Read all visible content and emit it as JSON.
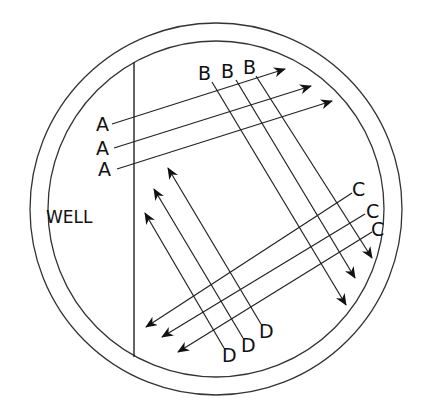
{
  "diagram": {
    "title": "",
    "plate": {
      "center": [
        216,
        209
      ],
      "outer_radius": 186,
      "inner_radius": 168,
      "line_color": "#333333"
    },
    "well": {
      "label": "WELL",
      "label_pos": [
        46,
        223
      ],
      "divider": {
        "x": 134,
        "y1": 62,
        "y2": 357
      }
    },
    "streak_sets": [
      {
        "letter": "A",
        "labels": [
          {
            "text": "A",
            "x": 96,
            "y": 131
          },
          {
            "text": "A",
            "x": 96,
            "y": 155
          },
          {
            "text": "A",
            "x": 98,
            "y": 176
          }
        ],
        "arrows": [
          {
            "x1": 112,
            "y1": 124,
            "x2": 285,
            "y2": 69
          },
          {
            "x1": 114,
            "y1": 148,
            "x2": 311,
            "y2": 86
          },
          {
            "x1": 117,
            "y1": 169,
            "x2": 332,
            "y2": 101
          }
        ]
      },
      {
        "letter": "B",
        "labels": [
          {
            "text": "B",
            "x": 198,
            "y": 80
          },
          {
            "text": "B",
            "x": 221,
            "y": 78
          },
          {
            "text": "B",
            "x": 243,
            "y": 74
          }
        ],
        "arrows": [
          {
            "x1": 212,
            "y1": 82,
            "x2": 346,
            "y2": 305
          },
          {
            "x1": 236,
            "y1": 80,
            "x2": 355,
            "y2": 278
          },
          {
            "x1": 256,
            "y1": 76,
            "x2": 372,
            "y2": 258
          }
        ]
      },
      {
        "letter": "C",
        "labels": [
          {
            "text": "C",
            "x": 352,
            "y": 196
          },
          {
            "text": "C",
            "x": 366,
            "y": 218
          },
          {
            "text": "C",
            "x": 371,
            "y": 236
          }
        ],
        "arrows": [
          {
            "x1": 352,
            "y1": 193,
            "x2": 146,
            "y2": 327
          },
          {
            "x1": 365,
            "y1": 214,
            "x2": 162,
            "y2": 337
          },
          {
            "x1": 372,
            "y1": 232,
            "x2": 178,
            "y2": 352
          }
        ]
      },
      {
        "letter": "D",
        "labels": [
          {
            "text": "D",
            "x": 222,
            "y": 362
          },
          {
            "text": "D",
            "x": 241,
            "y": 352
          },
          {
            "text": "D",
            "x": 259,
            "y": 338
          }
        ],
        "arrows": [
          {
            "x1": 224,
            "y1": 348,
            "x2": 145,
            "y2": 213
          },
          {
            "x1": 243,
            "y1": 338,
            "x2": 154,
            "y2": 189
          },
          {
            "x1": 261,
            "y1": 324,
            "x2": 168,
            "y2": 168
          }
        ]
      }
    ]
  }
}
